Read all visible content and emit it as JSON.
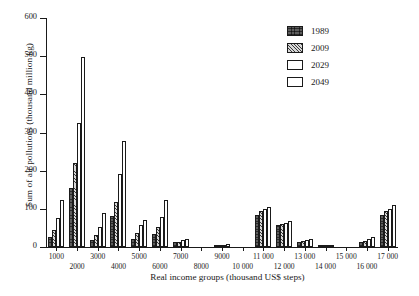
{
  "chart_data": {
    "type": "bar",
    "title": "",
    "xlabel": "Real income groups (thousand US$ steps)",
    "ylabel": "Sum of air pollutions (thousand million kg)",
    "ylim": [
      0,
      600
    ],
    "yticks": [
      0,
      100,
      200,
      300,
      400,
      500,
      600
    ],
    "ytick_labels": [
      "0",
      "100",
      "200",
      "300",
      "400",
      "500",
      "600"
    ],
    "grid": false,
    "legend_position": "top-right",
    "categories": [
      "1000",
      "2000",
      "3000",
      "4000",
      "5000",
      "6000",
      "7000",
      "8000",
      "9000",
      "10 000",
      "11 000",
      "12 000",
      "13 000",
      "14 000",
      "15 000",
      "16 000",
      "17 000"
    ],
    "series": [
      {
        "name": "1989",
        "pattern": "dense-cross-hatch",
        "values": [
          25,
          155,
          18,
          80,
          22,
          35,
          12,
          0,
          2,
          0,
          85,
          58,
          12,
          2,
          0,
          12,
          85
        ]
      },
      {
        "name": "2009",
        "pattern": "diagonal-hatch",
        "values": [
          45,
          220,
          32,
          118,
          38,
          52,
          14,
          0,
          3,
          0,
          95,
          60,
          15,
          3,
          0,
          16,
          95
        ]
      },
      {
        "name": "2029",
        "pattern": "stipple-dots",
        "values": [
          75,
          325,
          52,
          190,
          58,
          78,
          18,
          0,
          5,
          0,
          100,
          63,
          18,
          3,
          0,
          20,
          100
        ]
      },
      {
        "name": "2049",
        "pattern": "empty-white",
        "values": [
          122,
          497,
          88,
          278,
          70,
          122,
          22,
          0,
          7,
          0,
          105,
          68,
          22,
          4,
          0,
          25,
          110
        ]
      }
    ]
  },
  "legend": {
    "items": [
      {
        "label": "1989"
      },
      {
        "label": "2009"
      },
      {
        "label": "2029"
      },
      {
        "label": "2049"
      }
    ]
  },
  "colors": {
    "axis": "#1a1a1a",
    "series_1989": "#5d5d5d",
    "series_2009": "#d8d8d8",
    "series_2029": "#ffffff",
    "series_2049": "#ffffff",
    "background": "#ffffff"
  }
}
